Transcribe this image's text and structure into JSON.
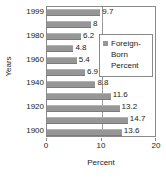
{
  "chart_data": {
    "type": "bar",
    "orientation": "horizontal",
    "title": "",
    "xlabel": "Percent",
    "ylabel": "Years",
    "xlim": [
      0,
      20
    ],
    "xticks": [
      "0",
      "10",
      "20"
    ],
    "xtick_values": [
      0,
      10,
      20
    ],
    "grid": "vertical-midline-at-10",
    "legend": {
      "position": "inside-right-upper",
      "entries": [
        {
          "label": "Foreign-\nBorn\nPercent",
          "color": "#969696",
          "marker": "square"
        }
      ]
    },
    "categories": [
      "1999",
      "1990",
      "1980",
      "1970",
      "1960",
      "1950",
      "1940",
      "1930",
      "1920",
      "1910",
      "1900"
    ],
    "ytick_labels_shown": [
      "1999",
      "1980",
      "1960",
      "1940",
      "1920",
      "1900"
    ],
    "values": [
      9.7,
      8,
      6.2,
      4.8,
      5.4,
      6.9,
      8.8,
      11.6,
      13.2,
      14.7,
      13.6
    ],
    "value_labels": [
      "9.7",
      "8",
      "6.2",
      "4.8",
      "5.4",
      "6.9",
      "8.8",
      "11.6",
      "13.2",
      "14.7",
      "13.6"
    ],
    "series": [
      {
        "name": "Foreign-Born Percent",
        "values": [
          9.7,
          8,
          6.2,
          4.8,
          5.4,
          6.9,
          8.8,
          11.6,
          13.2,
          14.7,
          13.6
        ]
      }
    ],
    "colors": {
      "bar": "#969696",
      "axis": "#8a8a8a",
      "gridline": "#9a9a9a",
      "text": "#1a1a1a",
      "background": "#ffffff"
    }
  }
}
